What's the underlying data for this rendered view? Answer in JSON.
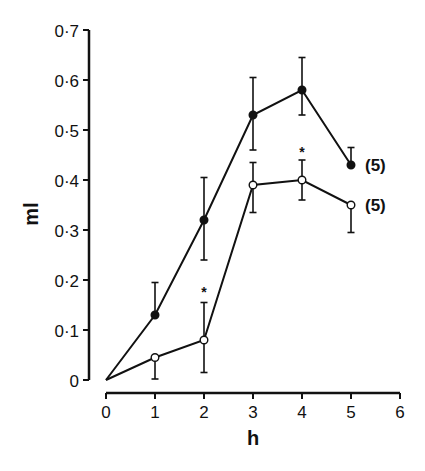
{
  "chart_data": {
    "type": "line",
    "title": "",
    "xlabel": "h",
    "ylabel": "ml",
    "xlim": [
      0,
      6
    ],
    "ylim": [
      0,
      0.7
    ],
    "x_ticks": [
      "0",
      "1",
      "2",
      "3",
      "4",
      "5",
      "6"
    ],
    "y_ticks": [
      "0",
      "0·1",
      "0·2",
      "0·3",
      "0·4",
      "0·5",
      "0·6",
      "0·7"
    ],
    "grid": false,
    "legend": null,
    "x": [
      0,
      1,
      2,
      3,
      4,
      5
    ],
    "series": [
      {
        "name": "filled circles",
        "marker": "filled-circle",
        "values": [
          0,
          0.13,
          0.32,
          0.53,
          0.58,
          0.43
        ],
        "error_upper": [
          null,
          0.195,
          0.405,
          0.605,
          0.645,
          0.465
        ],
        "error_lower": [
          null,
          null,
          0.24,
          0.46,
          0.53,
          null
        ],
        "end_label": "(5)"
      },
      {
        "name": "open circles",
        "marker": "open-circle",
        "values": [
          0,
          0.045,
          0.08,
          0.39,
          0.4,
          0.35
        ],
        "error_upper": [
          null,
          null,
          0.155,
          0.435,
          0.44,
          null
        ],
        "error_lower": [
          null,
          0.002,
          0.015,
          0.335,
          0.36,
          0.295
        ],
        "end_label": "(5)"
      }
    ],
    "annotations": [
      {
        "text": "*",
        "x": 2,
        "y": 0.18
      },
      {
        "text": "*",
        "x": 4,
        "y": 0.46
      }
    ]
  }
}
